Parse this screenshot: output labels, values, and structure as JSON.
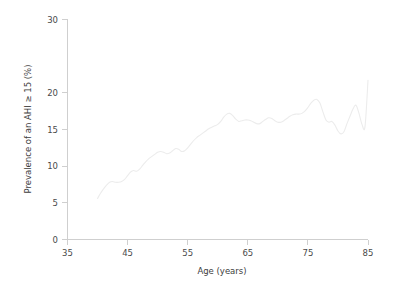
{
  "figure": {
    "background_color": "#ffffff",
    "line_color": "#ececec",
    "axis_color": "#cfcfcf",
    "text_color": "#3d3d3d"
  },
  "axes": {
    "x_title": "Age (years)",
    "y_title": "Prevalence of an AHI ≥ 15 (%)",
    "x_ticks": [
      "35",
      "45",
      "55",
      "65",
      "75",
      "85"
    ],
    "y_ticks": [
      "0",
      "5",
      "10",
      "15",
      "20",
      "30"
    ]
  },
  "chart_data": {
    "type": "line",
    "title": "",
    "subtitle": "",
    "xlabel": "Age (years)",
    "ylabel": "Prevalence of an AHI ≥ 15 (%)",
    "xlim": [
      35,
      85
    ],
    "ylim": [
      0,
      30
    ],
    "xticks": [
      35,
      45,
      55,
      65,
      75,
      85
    ],
    "xticklabels": [
      "35",
      "45",
      "55",
      "65",
      "75",
      "85"
    ],
    "yticks": [
      0,
      5,
      10,
      15,
      20,
      30
    ],
    "yticklabels": [
      "0",
      "5",
      "10",
      "15",
      "20",
      "30"
    ],
    "grid": false,
    "legend": null,
    "legend_position": "none",
    "annotations": [],
    "series": [
      {
        "name": "Prevalence of an AHI ≥ 15 (%)",
        "color": "#ececec",
        "x": [
          40.0,
          40.5,
          41.0,
          41.5,
          42.0,
          42.5,
          43.0,
          43.5,
          44.0,
          44.5,
          45.0,
          45.5,
          46.0,
          46.5,
          47.0,
          47.5,
          48.0,
          48.5,
          49.0,
          49.5,
          50.0,
          50.5,
          51.0,
          51.5,
          52.0,
          52.5,
          53.0,
          53.5,
          54.0,
          54.5,
          55.0,
          55.5,
          56.0,
          56.5,
          57.0,
          57.5,
          58.0,
          58.5,
          59.0,
          59.5,
          60.0,
          60.5,
          61.0,
          61.5,
          62.0,
          62.5,
          63.0,
          63.5,
          64.0,
          64.5,
          65.0,
          65.5,
          66.0,
          66.5,
          67.0,
          67.5,
          68.0,
          68.5,
          69.0,
          69.5,
          70.0,
          70.5,
          71.0,
          71.5,
          72.0,
          72.5,
          73.0,
          73.5,
          74.0,
          74.5,
          75.0,
          75.5,
          76.0,
          76.5,
          77.0,
          77.5,
          78.0,
          78.5,
          79.0,
          79.5,
          80.0,
          80.5,
          81.0,
          81.5,
          82.0,
          82.5,
          83.0,
          83.5,
          84.0,
          84.5,
          85.0
        ],
        "y": [
          5.6,
          6.3,
          6.9,
          7.4,
          7.8,
          7.9,
          7.8,
          7.8,
          7.9,
          8.2,
          8.7,
          9.2,
          9.4,
          9.3,
          9.6,
          10.1,
          10.6,
          11.0,
          11.3,
          11.6,
          11.9,
          12.0,
          11.9,
          11.7,
          11.8,
          12.1,
          12.4,
          12.3,
          12.0,
          12.1,
          12.5,
          13.0,
          13.5,
          13.9,
          14.2,
          14.5,
          14.8,
          15.1,
          15.3,
          15.5,
          15.7,
          16.1,
          16.7,
          17.1,
          17.2,
          16.9,
          16.4,
          16.1,
          16.2,
          16.3,
          16.3,
          16.2,
          16.0,
          15.8,
          15.8,
          16.1,
          16.4,
          16.6,
          16.5,
          16.2,
          16.0,
          16.0,
          16.2,
          16.5,
          16.8,
          17.0,
          17.1,
          17.1,
          17.2,
          17.5,
          18.0,
          18.6,
          19.0,
          19.1,
          18.6,
          17.4,
          16.3,
          16.0,
          16.1,
          15.6,
          14.8,
          14.4,
          14.7,
          15.8,
          16.8,
          17.8,
          18.3,
          17.2,
          15.7,
          15.4,
          21.7
        ]
      }
    ]
  }
}
